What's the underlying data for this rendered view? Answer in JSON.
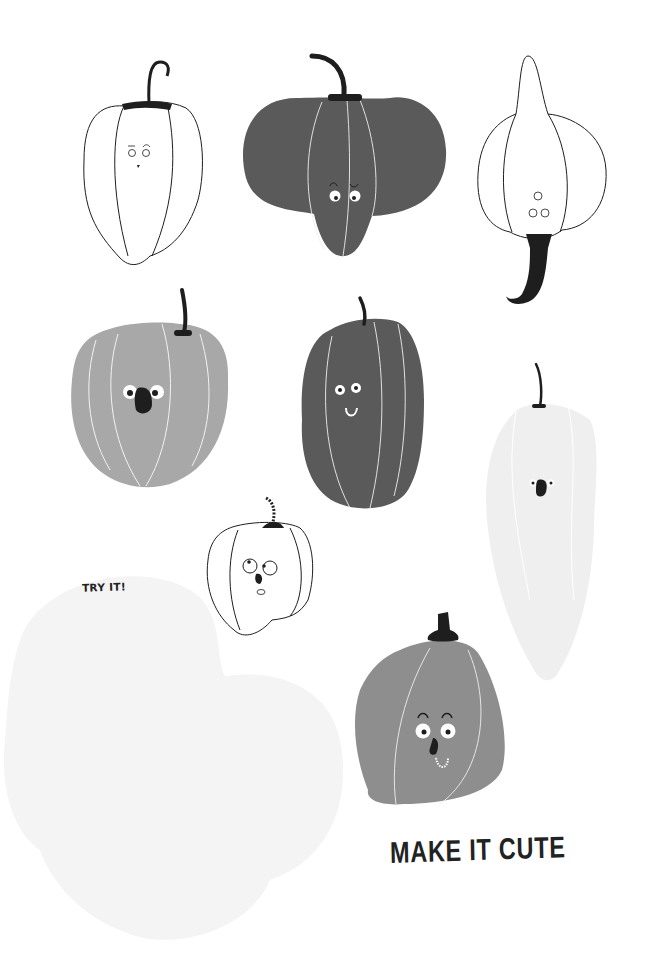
{
  "page": {
    "background": "#ffffff",
    "try_it_label": "TRY IT!",
    "title": "MAKE IT CUTE"
  },
  "colors": {
    "ink": "#1e1e1e",
    "dark_pepper": "#5a5a5a",
    "medium_pepper": "#a8a8a8",
    "bottom_pepper": "#8e8e8e",
    "pale_pepper": "#efefef",
    "practice_blob": "#f4f4f4",
    "white_line": "#f2f2f2"
  },
  "illustrations": [
    {
      "id": "pepper-1",
      "style": "outline",
      "face": "freckled, raised brows"
    },
    {
      "id": "pepper-2",
      "style": "dark gray",
      "face": "one winking eye"
    },
    {
      "id": "pepper-3",
      "style": "outline, upside down",
      "face": "small eyes"
    },
    {
      "id": "pepper-4",
      "style": "medium gray",
      "face": "big black nose"
    },
    {
      "id": "pepper-5",
      "style": "dark gray",
      "face": "smile"
    },
    {
      "id": "pepper-6",
      "style": "pale gray, tall",
      "face": "small black nose"
    },
    {
      "id": "pepper-7",
      "style": "dotted outline",
      "face": "surprised"
    },
    {
      "id": "pepper-8",
      "style": "gray",
      "face": "big eyes, toothy grin"
    }
  ]
}
